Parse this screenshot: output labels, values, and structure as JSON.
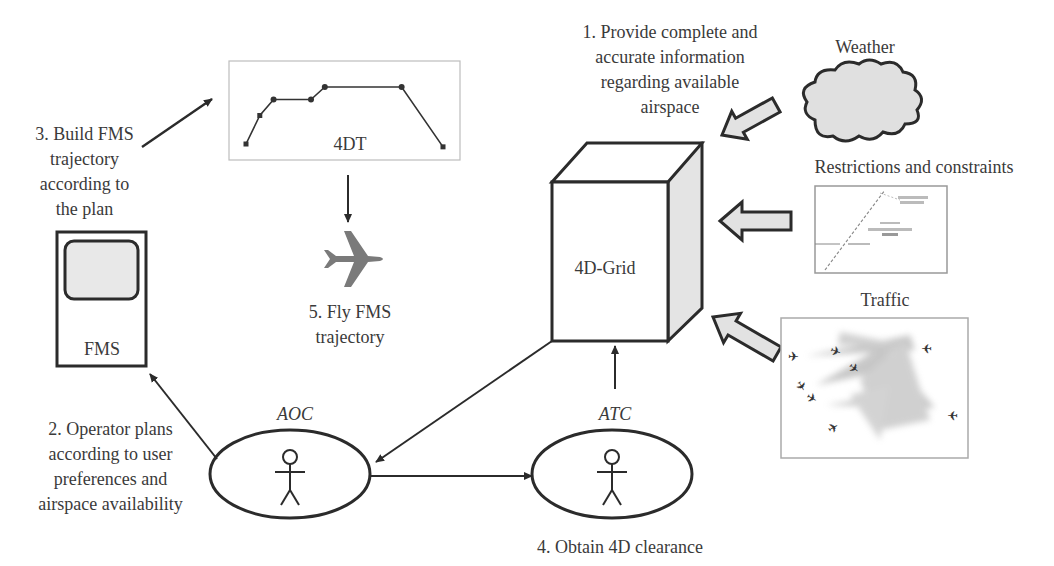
{
  "colors": {
    "stroke": "#2b2b2b",
    "fill_gray": "#e2e2e2",
    "plane_gray": "#7a7a7a",
    "text": "#3a3a3a",
    "frame": "#bdbdbd"
  },
  "labels": {
    "step1": "1. Provide complete and\naccurate information\nregarding available\nairspace",
    "step2": "2. Operator plans\naccording to user\npreferences  and\nairspace availability",
    "step3": "3. Build FMS\ntrajectory\naccording to\nthe plan",
    "step4": "4. Obtain 4D clearance",
    "step5": "5. Fly FMS\ntrajectory",
    "weather": "Weather",
    "restrictions": "Restrictions and constraints",
    "traffic": "Traffic",
    "grid": "4D-Grid",
    "fms": "FMS",
    "trajectory": "4DT",
    "aoc": "AOC",
    "atc": "ATC"
  },
  "trajectory_profile": {
    "description": "4D trajectory profile: climb, level, climb, cruise, descent",
    "points": [
      {
        "x": 0.0,
        "y": 0.0
      },
      {
        "x": 0.07,
        "y": 0.5
      },
      {
        "x": 0.14,
        "y": 0.78
      },
      {
        "x": 0.33,
        "y": 0.78
      },
      {
        "x": 0.4,
        "y": 1.0
      },
      {
        "x": 0.79,
        "y": 1.0
      },
      {
        "x": 1.0,
        "y": -0.05
      }
    ]
  },
  "icons": {
    "actor": "stick-figure",
    "aircraft": "airplane",
    "weather": "cloud",
    "restrictions": "chart-map",
    "traffic": "traffic-map"
  }
}
